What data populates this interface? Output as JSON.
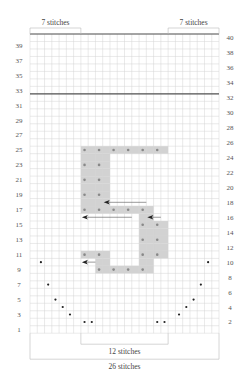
{
  "grid": {
    "columns": 26,
    "rows": 40,
    "origin_x": 30,
    "origin_y": 34,
    "cell_w": 7.27,
    "cell_h": 7.48,
    "grid_color": "#d4d4d4",
    "border_color": "#555555",
    "shade_color": "#d2d2d2",
    "thick_line_rows": [
      32,
      40
    ]
  },
  "labels": {
    "top_left": "7 stitches",
    "top_right": "7 stitches",
    "bottom_inner": "12 stitches",
    "bottom_outer": "26 stitches"
  },
  "row_numbers": {
    "left_odd": [
      39,
      37,
      35,
      33,
      31,
      29,
      27,
      25,
      23,
      21,
      19,
      17,
      15,
      13,
      11,
      9,
      7,
      5,
      3,
      1
    ],
    "right_even": [
      40,
      38,
      36,
      34,
      32,
      30,
      28,
      26,
      24,
      22,
      20,
      18,
      16,
      14,
      12,
      10,
      8,
      6,
      4,
      2
    ]
  },
  "shaded_cells": [
    {
      "row": 25,
      "from": 7,
      "to": 18
    },
    {
      "row": 24,
      "from": 7,
      "to": 10
    },
    {
      "row": 23,
      "from": 7,
      "to": 10
    },
    {
      "row": 22,
      "from": 7,
      "to": 10
    },
    {
      "row": 21,
      "from": 7,
      "to": 10
    },
    {
      "row": 20,
      "from": 7,
      "to": 10
    },
    {
      "row": 19,
      "from": 7,
      "to": 10
    },
    {
      "row": 18,
      "from": 7,
      "to": 10
    },
    {
      "row": 17,
      "from": 7,
      "to": 16
    },
    {
      "row": 16,
      "from": 15,
      "to": 16
    },
    {
      "row": 15,
      "from": 15,
      "to": 18
    },
    {
      "row": 14,
      "from": 15,
      "to": 18
    },
    {
      "row": 13,
      "from": 15,
      "to": 18
    },
    {
      "row": 12,
      "from": 15,
      "to": 18
    },
    {
      "row": 11,
      "from": 7,
      "to": 10
    },
    {
      "row": 11,
      "from": 15,
      "to": 18
    },
    {
      "row": 10,
      "from": 9,
      "to": 10
    },
    {
      "row": 10,
      "from": 15,
      "to": 16
    },
    {
      "row": 9,
      "from": 9,
      "to": 16
    }
  ],
  "pattern_dots": [
    {
      "row": 25,
      "cols": [
        7,
        9,
        11,
        13,
        15,
        17
      ]
    },
    {
      "row": 23,
      "cols": [
        7,
        9
      ]
    },
    {
      "row": 21,
      "cols": [
        7,
        9
      ]
    },
    {
      "row": 19,
      "cols": [
        7,
        9
      ]
    },
    {
      "row": 17,
      "cols": [
        7,
        9,
        11,
        13,
        15
      ]
    },
    {
      "row": 15,
      "cols": [
        15,
        17
      ]
    },
    {
      "row": 13,
      "cols": [
        15,
        17
      ]
    },
    {
      "row": 11,
      "cols": [
        7,
        9,
        15,
        17
      ]
    },
    {
      "row": 9,
      "cols": [
        9,
        11,
        13,
        15
      ]
    }
  ],
  "decrease_dots": [
    {
      "row": 10,
      "cols": [
        1,
        24
      ]
    },
    {
      "row": 7,
      "cols": [
        2,
        23
      ]
    },
    {
      "row": 5,
      "cols": [
        3,
        22
      ]
    },
    {
      "row": 4,
      "cols": [
        4,
        21
      ]
    },
    {
      "row": 3,
      "cols": [
        5,
        20
      ]
    },
    {
      "row": 2,
      "cols": [
        7,
        8,
        17,
        18
      ]
    }
  ],
  "arrows": [
    {
      "row": 18,
      "col_start": 10,
      "col_end": 16
    },
    {
      "row": 16,
      "col_start": 7,
      "col_end": 14
    },
    {
      "row": 16,
      "col_start": 16,
      "col_end": 18
    },
    {
      "row": 10,
      "col_start": 7,
      "col_end": 9
    }
  ]
}
